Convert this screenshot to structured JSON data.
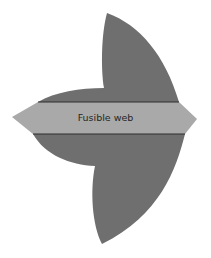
{
  "diagram": {
    "label": "Fusible web",
    "colors": {
      "fabric_fill": "#6f6f6f",
      "band_fill": "#a9a9a9",
      "band_border": "#2e2e2e",
      "text": "#262626",
      "background": "#ffffff"
    }
  }
}
